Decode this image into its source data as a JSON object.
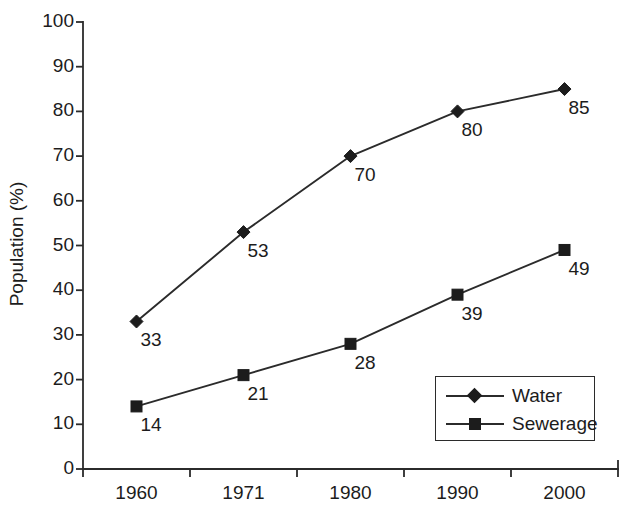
{
  "chart_data": {
    "type": "line",
    "title": "",
    "xlabel": "",
    "ylabel": "Population (%)",
    "categories": [
      "1960",
      "1971",
      "1980",
      "1990",
      "2000"
    ],
    "ylim": [
      0,
      100
    ],
    "yticks": [
      "0",
      "10",
      "20",
      "30",
      "40",
      "50",
      "60",
      "70",
      "80",
      "90",
      "100"
    ],
    "grid": false,
    "legend_position": "lower-right",
    "series": [
      {
        "name": "Water",
        "marker": "diamond",
        "values": [
          33,
          53,
          70,
          80,
          85
        ],
        "labels": [
          "33",
          "53",
          "70",
          "80",
          "85"
        ]
      },
      {
        "name": "Sewerage",
        "marker": "square",
        "values": [
          14,
          21,
          28,
          39,
          49
        ],
        "labels": [
          "14",
          "21",
          "28",
          "39",
          "49"
        ]
      }
    ]
  },
  "colors": {
    "ink": "#1c1c1c",
    "axis": "#2b2b2b",
    "background": "#ffffff"
  }
}
